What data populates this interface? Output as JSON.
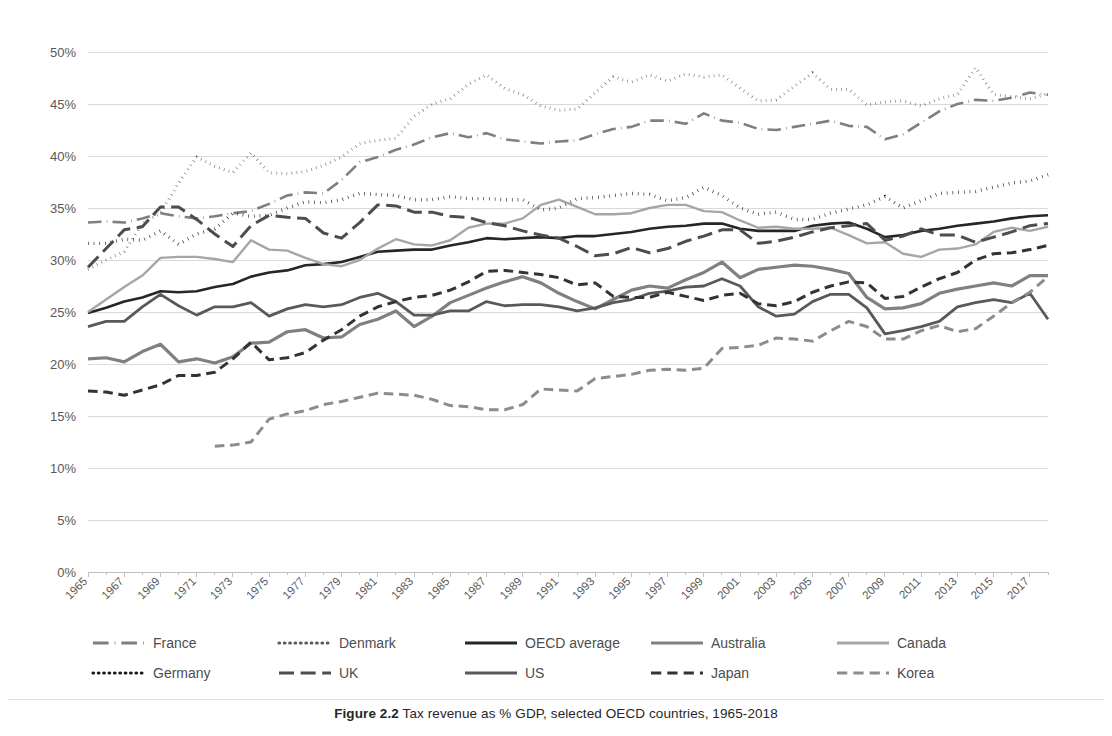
{
  "figure": {
    "caption_label": "Figure 2.2",
    "caption_text": "Tax revenue as % GDP, selected OECD countries, 1965-2018"
  },
  "chart_data": {
    "type": "line",
    "title": "",
    "xlabel": "",
    "ylabel": "",
    "ylim": [
      0,
      50
    ],
    "yticks": [
      "0%",
      "5%",
      "10%",
      "15%",
      "20%",
      "25%",
      "30%",
      "35%",
      "40%",
      "45%",
      "50%"
    ],
    "ytick_values": [
      0,
      5,
      10,
      15,
      20,
      25,
      30,
      35,
      40,
      45,
      50
    ],
    "grid": true,
    "legend_position": "bottom",
    "x_start": 1965,
    "x_end": 2018,
    "xtick_labels": [
      "1965",
      "1967",
      "1969",
      "1971",
      "1973",
      "1975",
      "1977",
      "1979",
      "1981",
      "1983",
      "1985",
      "1987",
      "1989",
      "1991",
      "1993",
      "1995",
      "1997",
      "1999",
      "2001",
      "2003",
      "2005",
      "2007",
      "2009",
      "2011",
      "2013",
      "2015",
      "2017"
    ],
    "x": [
      1965,
      1966,
      1967,
      1968,
      1969,
      1970,
      1971,
      1972,
      1973,
      1974,
      1975,
      1976,
      1977,
      1978,
      1979,
      1980,
      1981,
      1982,
      1983,
      1984,
      1985,
      1986,
      1987,
      1988,
      1989,
      1990,
      1991,
      1992,
      1993,
      1994,
      1995,
      1996,
      1997,
      1998,
      1999,
      2000,
      2001,
      2002,
      2003,
      2004,
      2005,
      2006,
      2007,
      2008,
      2009,
      2010,
      2011,
      2012,
      2013,
      2014,
      2015,
      2016,
      2017,
      2018
    ],
    "series": [
      {
        "name": "France",
        "style": "dash-dot",
        "color": "#7f7f7f",
        "width": 2.6,
        "values": [
          33.6,
          33.7,
          33.6,
          34.0,
          34.5,
          34.2,
          34.0,
          34.2,
          34.5,
          34.7,
          35.4,
          36.2,
          36.5,
          36.4,
          37.7,
          39.4,
          39.9,
          40.6,
          41.1,
          41.8,
          42.2,
          41.8,
          42.2,
          41.6,
          41.4,
          41.2,
          41.4,
          41.5,
          42.1,
          42.6,
          42.8,
          43.4,
          43.4,
          43.1,
          44.1,
          43.4,
          43.2,
          42.6,
          42.5,
          42.8,
          43.1,
          43.4,
          42.9,
          42.8,
          41.6,
          42.1,
          43.2,
          44.3,
          45.0,
          45.4,
          45.3,
          45.6,
          46.1,
          45.9
        ]
      },
      {
        "name": "Denmark",
        "style": "dotted",
        "color": "#595959",
        "width": 3.0,
        "values": [
          29.1,
          30.0,
          30.8,
          33.5,
          34.5,
          37.4,
          39.9,
          39.0,
          38.4,
          40.3,
          38.4,
          38.3,
          38.5,
          39.1,
          39.9,
          41.2,
          41.5,
          41.7,
          43.8,
          45.0,
          45.5,
          46.9,
          47.8,
          46.5,
          45.9,
          44.8,
          44.4,
          44.5,
          46.1,
          47.6,
          47.1,
          47.8,
          47.2,
          47.9,
          47.6,
          47.8,
          46.5,
          45.3,
          45.4,
          46.7,
          48.0,
          46.4,
          46.4,
          44.9,
          45.2,
          45.3,
          44.8,
          45.5,
          45.9,
          48.5,
          45.9,
          45.7,
          45.5,
          46.0
        ]
      },
      {
        "name": "OECD average",
        "style": "solid",
        "color": "#262626",
        "width": 2.6,
        "values": [
          24.9,
          25.4,
          26.0,
          26.4,
          27.0,
          26.9,
          27.0,
          27.4,
          27.7,
          28.4,
          28.8,
          29.0,
          29.5,
          29.6,
          29.8,
          30.3,
          30.8,
          30.9,
          31.0,
          31.0,
          31.4,
          31.7,
          32.1,
          32.0,
          32.1,
          32.2,
          32.1,
          32.3,
          32.3,
          32.5,
          32.7,
          33.0,
          33.2,
          33.3,
          33.5,
          33.5,
          33.0,
          32.8,
          32.8,
          32.8,
          33.3,
          33.5,
          33.6,
          33.0,
          32.2,
          32.4,
          32.8,
          33.0,
          33.3,
          33.5,
          33.7,
          34.0,
          34.2,
          34.3
        ]
      },
      {
        "name": "Australia",
        "style": "solid",
        "color": "#808080",
        "width": 3.2,
        "values": [
          20.5,
          20.6,
          20.2,
          21.2,
          21.9,
          20.2,
          20.5,
          20.1,
          20.7,
          22.0,
          22.1,
          23.1,
          23.3,
          22.5,
          22.6,
          23.8,
          24.3,
          25.1,
          23.6,
          24.6,
          25.9,
          26.6,
          27.3,
          27.9,
          28.4,
          27.8,
          26.8,
          26.0,
          25.3,
          26.2,
          27.1,
          27.5,
          27.3,
          28.1,
          28.8,
          29.8,
          28.3,
          29.1,
          29.3,
          29.5,
          29.4,
          29.1,
          28.7,
          26.4,
          25.3,
          25.4,
          25.8,
          26.8,
          27.2,
          27.5,
          27.8,
          27.5,
          28.5,
          28.5
        ]
      },
      {
        "name": "Canada",
        "style": "solid",
        "color": "#a6a6a6",
        "width": 2.4,
        "values": [
          25.0,
          26.2,
          27.4,
          28.5,
          30.2,
          30.3,
          30.3,
          30.1,
          29.8,
          31.9,
          31.0,
          30.9,
          30.2,
          29.6,
          29.4,
          30.0,
          31.1,
          32.0,
          31.5,
          31.4,
          31.9,
          33.1,
          33.5,
          33.5,
          34.0,
          35.3,
          35.8,
          35.1,
          34.4,
          34.4,
          34.5,
          35.0,
          35.3,
          35.3,
          34.7,
          34.6,
          33.8,
          33.1,
          33.2,
          33.0,
          33.0,
          33.1,
          32.4,
          31.6,
          31.7,
          30.6,
          30.3,
          31.0,
          31.1,
          31.5,
          32.7,
          33.1,
          32.8,
          33.2
        ]
      },
      {
        "name": "Germany",
        "style": "dotted",
        "color": "#1a1a1a",
        "width": 3.4,
        "values": [
          31.6,
          31.6,
          32.0,
          31.9,
          32.8,
          31.5,
          32.5,
          33.0,
          34.5,
          34.2,
          34.3,
          35.0,
          35.6,
          35.5,
          35.8,
          36.4,
          36.3,
          36.2,
          35.8,
          35.8,
          36.1,
          35.9,
          35.9,
          35.8,
          35.8,
          34.8,
          35.0,
          35.9,
          36.0,
          36.2,
          36.4,
          36.3,
          35.7,
          36.0,
          37.0,
          36.2,
          35.0,
          34.4,
          34.6,
          33.9,
          33.9,
          34.5,
          34.9,
          35.3,
          36.1,
          35.0,
          35.7,
          36.4,
          36.5,
          36.6,
          37.0,
          37.4,
          37.6,
          38.2
        ]
      },
      {
        "name": "UK",
        "style": "long-dash",
        "color": "#4d4d4d",
        "width": 3.0,
        "values": [
          29.3,
          31.1,
          32.9,
          33.2,
          35.1,
          35.1,
          33.9,
          32.5,
          31.3,
          33.3,
          34.3,
          34.1,
          34.0,
          32.6,
          32.1,
          33.6,
          35.3,
          35.2,
          34.6,
          34.6,
          34.2,
          34.1,
          33.6,
          33.3,
          32.8,
          32.4,
          32.1,
          31.3,
          30.4,
          30.6,
          31.2,
          30.7,
          31.1,
          31.8,
          32.3,
          32.9,
          32.9,
          31.6,
          31.8,
          32.2,
          32.7,
          33.1,
          33.3,
          33.5,
          31.9,
          32.3,
          33.0,
          32.4,
          32.4,
          31.7,
          32.2,
          32.7,
          33.3,
          33.5
        ]
      },
      {
        "name": "US",
        "style": "solid",
        "color": "#595959",
        "width": 2.8,
        "values": [
          23.6,
          24.1,
          24.1,
          25.5,
          26.7,
          25.6,
          24.7,
          25.5,
          25.5,
          25.9,
          24.6,
          25.3,
          25.7,
          25.5,
          25.7,
          26.4,
          26.8,
          26.0,
          24.7,
          24.7,
          25.1,
          25.1,
          26.0,
          25.6,
          25.7,
          25.7,
          25.5,
          25.1,
          25.4,
          25.9,
          26.2,
          26.8,
          27.0,
          27.4,
          27.5,
          28.2,
          27.5,
          25.5,
          24.6,
          24.8,
          26.0,
          26.7,
          26.7,
          25.4,
          22.9,
          23.2,
          23.6,
          24.1,
          25.5,
          25.9,
          26.2,
          25.9,
          26.8,
          24.3
        ]
      },
      {
        "name": "Japan",
        "style": "dashed",
        "color": "#333333",
        "width": 3.0,
        "values": [
          17.4,
          17.3,
          17.0,
          17.5,
          18.0,
          18.9,
          18.9,
          19.2,
          20.5,
          22.1,
          20.4,
          20.6,
          21.1,
          22.3,
          23.3,
          24.6,
          25.5,
          26.0,
          26.4,
          26.6,
          27.1,
          27.9,
          28.9,
          29.0,
          28.8,
          28.6,
          28.3,
          27.6,
          27.8,
          26.5,
          26.4,
          26.4,
          26.9,
          26.5,
          26.1,
          26.6,
          26.8,
          25.8,
          25.6,
          26.0,
          26.9,
          27.5,
          27.9,
          27.8,
          26.3,
          26.5,
          27.4,
          28.2,
          28.8,
          30.0,
          30.6,
          30.7,
          31.0,
          31.4
        ]
      },
      {
        "name": "Korea",
        "style": "dashed",
        "color": "#8c8c8c",
        "width": 3.0,
        "values": [
          null,
          null,
          null,
          null,
          null,
          null,
          null,
          12.1,
          12.2,
          12.5,
          14.7,
          15.2,
          15.5,
          16.1,
          16.4,
          16.8,
          17.2,
          17.1,
          17.0,
          16.6,
          16.0,
          15.9,
          15.6,
          15.6,
          16.1,
          17.6,
          17.5,
          17.4,
          18.6,
          18.8,
          19.0,
          19.4,
          19.5,
          19.4,
          19.6,
          21.5,
          21.6,
          21.8,
          22.5,
          22.4,
          22.2,
          23.2,
          24.1,
          23.6,
          22.4,
          22.4,
          23.2,
          23.7,
          23.1,
          23.4,
          24.6,
          25.9,
          26.9,
          28.4
        ]
      }
    ]
  },
  "legend": {
    "rows": [
      [
        {
          "label": "France",
          "style": "dash-dot",
          "color": "#7f7f7f"
        },
        {
          "label": "Denmark",
          "style": "dotted",
          "color": "#595959"
        },
        {
          "label": "OECD average",
          "style": "solid",
          "color": "#262626"
        },
        {
          "label": "Australia",
          "style": "solid",
          "color": "#808080"
        },
        {
          "label": "Canada",
          "style": "solid",
          "color": "#a6a6a6"
        }
      ],
      [
        {
          "label": "Germany",
          "style": "dotted",
          "color": "#1a1a1a"
        },
        {
          "label": "UK",
          "style": "long-dash",
          "color": "#4d4d4d"
        },
        {
          "label": "US",
          "style": "solid",
          "color": "#595959"
        },
        {
          "label": "Japan",
          "style": "dashed",
          "color": "#333333"
        },
        {
          "label": "Korea",
          "style": "dashed",
          "color": "#8c8c8c"
        }
      ]
    ]
  }
}
